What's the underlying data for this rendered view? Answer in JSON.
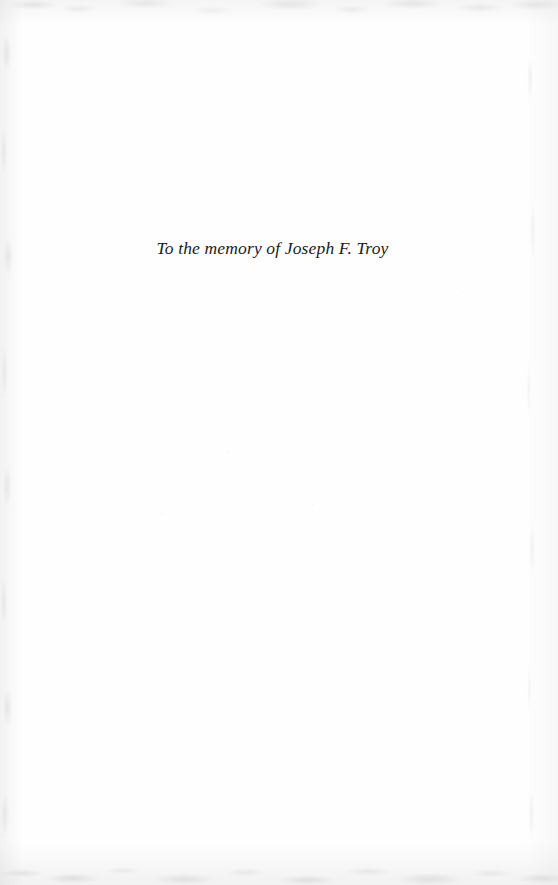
{
  "page": {
    "kind": "book-dedication-page",
    "background_color": "#fefefe",
    "width": 558,
    "height": 885
  },
  "dedication": {
    "text": "To the memory of Joseph F. Troy",
    "style": "italic",
    "alignment": "center",
    "text_color": "#1a1a1a"
  },
  "scan_artifacts": {
    "top_edge_label": "scan-edge-top",
    "bottom_edge_label": "scan-edge-bottom",
    "left_edge_label": "scan-edge-left",
    "right_edge_label": "scan-edge-right",
    "speckle_label": "scan-specks",
    "tint_color": "#9a9a9a"
  }
}
